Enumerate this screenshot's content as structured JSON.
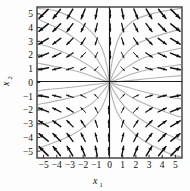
{
  "figure": {
    "kind": "phase-portrait",
    "background_color": "#fdfdfd",
    "frame_color": "#2b2b2b",
    "axis_color": "#1a1a1a",
    "arrow_color": "#111111",
    "trajectory_color": "#b2b2b2"
  },
  "axes": {
    "x": {
      "title": "x",
      "subscript": "1",
      "ticks": [
        "-5",
        "-4",
        "-3",
        "-2",
        "-1",
        "0",
        "1",
        "2",
        "3",
        "4",
        "5"
      ],
      "tick_values": [
        -5,
        -4,
        -3,
        -2,
        -1,
        0,
        1,
        2,
        3,
        4,
        5
      ],
      "range": [
        -5.5,
        5.5
      ]
    },
    "y": {
      "title": "x",
      "subscript": "2",
      "ticks": [
        "5",
        "4",
        "3",
        "2",
        "1",
        "0",
        "-1",
        "-2",
        "-3",
        "-4",
        "-5"
      ],
      "tick_values": [
        5,
        4,
        3,
        2,
        1,
        0,
        -1,
        -2,
        -3,
        -4,
        -5
      ],
      "range": [
        -5.5,
        5.5
      ]
    }
  },
  "chart_data": {
    "type": "scatter",
    "title": "",
    "xlabel": "x1",
    "ylabel": "x2",
    "xlim": [
      -5.5,
      5.5
    ],
    "ylim": [
      -5.5,
      5.5
    ],
    "grid": false,
    "legend": null,
    "equilibrium": [
      0,
      0
    ],
    "vector_field_rule": "dx1/dt = x1, dx2/dt = -x2 (saddle at origin)",
    "field_sample_spacing": 1,
    "field_sample_x": [
      -5,
      -4,
      -3,
      -2,
      -1,
      1,
      2,
      3,
      4,
      5
    ],
    "field_sample_y": [
      -5,
      -4,
      -3,
      -2,
      -1,
      1,
      2,
      3,
      4,
      5
    ],
    "quadrant_directions": {
      "q1_x_pos_y_pos": "right / up-right",
      "q2_x_neg_y_pos": "up-left",
      "q3_x_neg_y_neg": "left / down-left",
      "q4_x_pos_y_neg": "down-right"
    },
    "trajectories": [
      {
        "name": "q1-a",
        "points": [
          [
            0.02,
            0.05
          ],
          [
            0.1,
            0.9
          ],
          [
            0.35,
            2.2
          ],
          [
            0.9,
            3.6
          ],
          [
            2.0,
            4.6
          ],
          [
            3.6,
            5.1
          ],
          [
            5.4,
            5.4
          ]
        ]
      },
      {
        "name": "q1-b",
        "points": [
          [
            0.03,
            0.04
          ],
          [
            0.3,
            0.7
          ],
          [
            0.9,
            1.7
          ],
          [
            1.9,
            2.7
          ],
          [
            3.3,
            3.3
          ],
          [
            5.4,
            3.9
          ]
        ]
      },
      {
        "name": "q1-c",
        "points": [
          [
            0.04,
            0.03
          ],
          [
            0.5,
            0.45
          ],
          [
            1.3,
            1.1
          ],
          [
            2.6,
            1.8
          ],
          [
            4.0,
            2.2
          ],
          [
            5.4,
            2.5
          ]
        ]
      },
      {
        "name": "q1-d",
        "points": [
          [
            0.05,
            0.02
          ],
          [
            0.7,
            0.25
          ],
          [
            1.8,
            0.65
          ],
          [
            3.2,
            1.0
          ],
          [
            5.4,
            1.3
          ]
        ]
      },
      {
        "name": "q1-e",
        "points": [
          [
            0.06,
            0.01
          ],
          [
            1.1,
            0.1
          ],
          [
            2.6,
            0.25
          ],
          [
            4.2,
            0.4
          ],
          [
            5.4,
            0.5
          ]
        ]
      },
      {
        "name": "q2-a",
        "points": [
          [
            -0.02,
            0.05
          ],
          [
            -0.15,
            1.0
          ],
          [
            -0.5,
            2.3
          ],
          [
            -1.2,
            3.5
          ],
          [
            -2.3,
            4.4
          ],
          [
            -4.0,
            5.2
          ],
          [
            -5.4,
            5.4
          ]
        ]
      },
      {
        "name": "q2-b",
        "points": [
          [
            -0.03,
            0.04
          ],
          [
            -0.4,
            0.8
          ],
          [
            -1.1,
            1.9
          ],
          [
            -2.2,
            2.9
          ],
          [
            -3.6,
            3.8
          ],
          [
            -5.4,
            4.6
          ]
        ]
      },
      {
        "name": "q2-c",
        "points": [
          [
            -0.04,
            0.03
          ],
          [
            -0.6,
            0.5
          ],
          [
            -1.6,
            1.25
          ],
          [
            -3.0,
            2.0
          ],
          [
            -4.6,
            2.6
          ],
          [
            -5.4,
            2.8
          ]
        ]
      },
      {
        "name": "q2-d",
        "points": [
          [
            -0.05,
            0.02
          ],
          [
            -0.9,
            0.3
          ],
          [
            -2.2,
            0.75
          ],
          [
            -3.8,
            1.1
          ],
          [
            -5.4,
            1.4
          ]
        ]
      },
      {
        "name": "q3-a",
        "points": [
          [
            -0.02,
            -0.05
          ],
          [
            -0.2,
            -0.9
          ],
          [
            -0.7,
            -2.0
          ],
          [
            -1.6,
            -3.0
          ],
          [
            -3.0,
            -3.9
          ],
          [
            -5.4,
            -4.8
          ]
        ]
      },
      {
        "name": "q3-b",
        "points": [
          [
            -0.03,
            -0.04
          ],
          [
            -0.45,
            -0.6
          ],
          [
            -1.3,
            -1.5
          ],
          [
            -2.6,
            -2.2
          ],
          [
            -4.2,
            -2.8
          ],
          [
            -5.4,
            -3.1
          ]
        ]
      },
      {
        "name": "q3-c",
        "points": [
          [
            -0.05,
            -0.03
          ],
          [
            -0.8,
            -0.35
          ],
          [
            -2.0,
            -0.85
          ],
          [
            -3.6,
            -1.25
          ],
          [
            -5.4,
            -1.6
          ]
        ]
      },
      {
        "name": "q3-d",
        "points": [
          [
            -0.06,
            -0.02
          ],
          [
            -1.2,
            -0.15
          ],
          [
            -2.9,
            -0.35
          ],
          [
            -4.6,
            -0.5
          ],
          [
            -5.4,
            -0.6
          ]
        ]
      },
      {
        "name": "q4-a",
        "points": [
          [
            0.02,
            -0.05
          ],
          [
            0.18,
            -1.0
          ],
          [
            0.6,
            -2.2
          ],
          [
            1.4,
            -3.3
          ],
          [
            2.7,
            -4.3
          ],
          [
            4.6,
            -5.2
          ],
          [
            5.4,
            -5.4
          ]
        ]
      },
      {
        "name": "q4-b",
        "points": [
          [
            0.03,
            -0.04
          ],
          [
            0.4,
            -0.75
          ],
          [
            1.2,
            -1.8
          ],
          [
            2.4,
            -2.7
          ],
          [
            4.0,
            -3.6
          ],
          [
            5.4,
            -4.2
          ]
        ]
      },
      {
        "name": "q4-c",
        "points": [
          [
            0.05,
            -0.03
          ],
          [
            0.7,
            -0.45
          ],
          [
            1.8,
            -1.15
          ],
          [
            3.3,
            -1.8
          ],
          [
            5.0,
            -2.4
          ],
          [
            5.4,
            -2.5
          ]
        ]
      },
      {
        "name": "q4-d",
        "points": [
          [
            0.06,
            -0.02
          ],
          [
            1.0,
            -0.25
          ],
          [
            2.5,
            -0.65
          ],
          [
            4.2,
            -1.0
          ],
          [
            5.4,
            -1.2
          ]
        ]
      },
      {
        "name": "sep-up",
        "points": [
          [
            0.0,
            0.05
          ],
          [
            0.0,
            2.0
          ],
          [
            0.0,
            5.4
          ]
        ]
      },
      {
        "name": "sep-down",
        "points": [
          [
            0.0,
            -0.05
          ],
          [
            0.0,
            -2.0
          ],
          [
            0.0,
            -5.4
          ]
        ]
      }
    ]
  }
}
